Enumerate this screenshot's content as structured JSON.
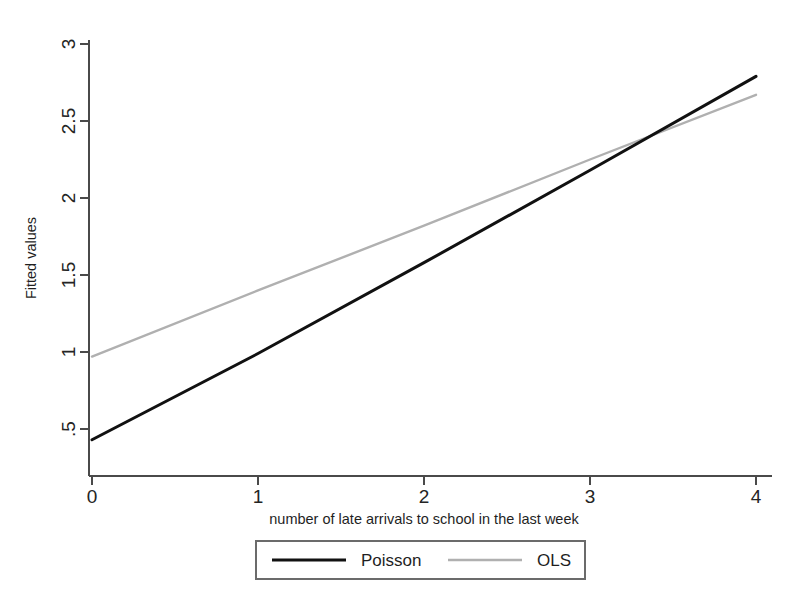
{
  "chart_data": {
    "type": "line",
    "title": "",
    "xlabel": "number of late arrivals to school in the last week",
    "ylabel": "Fitted values",
    "x": [
      0,
      4
    ],
    "xlim": [
      -0.08,
      4.12
    ],
    "ylim": [
      0.27,
      3.08
    ],
    "xticks": [
      "0",
      "1",
      "2",
      "3",
      "4"
    ],
    "xtick_values": [
      0,
      1,
      2,
      3,
      4
    ],
    "yticks": [
      ".5",
      "1",
      "1.5",
      "2",
      "2.5",
      "3"
    ],
    "ytick_values": [
      0.5,
      1,
      1.5,
      2,
      2.5,
      3
    ],
    "grid": false,
    "legend_position": "below-center",
    "series": [
      {
        "name": "Poisson",
        "color": "#111111",
        "width": 3.0,
        "x": [
          0,
          4
        ],
        "values": [
          0.43,
          2.79
        ],
        "points": [
          {
            "x": 0,
            "y": 0.43
          },
          {
            "x": 1,
            "y": 0.99
          },
          {
            "x": 2,
            "y": 1.58
          },
          {
            "x": 3,
            "y": 2.18
          },
          {
            "x": 4,
            "y": 2.79
          }
        ]
      },
      {
        "name": "OLS",
        "color": "#b0b0b0",
        "width": 2.4,
        "x": [
          0,
          4
        ],
        "values": [
          0.97,
          2.67
        ],
        "points": [
          {
            "x": 0,
            "y": 0.97
          },
          {
            "x": 1,
            "y": 1.4
          },
          {
            "x": 2,
            "y": 1.82
          },
          {
            "x": 3,
            "y": 2.25
          },
          {
            "x": 4,
            "y": 2.67
          }
        ]
      }
    ],
    "annotations": [
      {
        "text": "lines cross near x = 3.3, y = 2.37"
      }
    ]
  },
  "legend": {
    "entries": [
      {
        "label": "Poisson",
        "color": "#111111"
      },
      {
        "label": "OLS",
        "color": "#b0b0b0"
      }
    ]
  },
  "axes": {
    "y_title": "Fitted values",
    "x_title": "number of late arrivals to school in the last week",
    "y_tick_labels": [
      ".5",
      "1",
      "1.5",
      "2",
      "2.5",
      "3"
    ],
    "x_tick_labels": [
      "0",
      "1",
      "2",
      "3",
      "4"
    ]
  }
}
